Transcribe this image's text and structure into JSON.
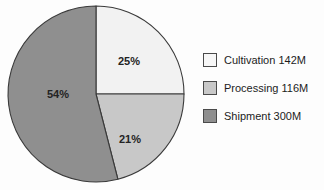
{
  "chart_data": {
    "type": "pie",
    "title": "",
    "categories": [
      "Cultivation",
      "Processing",
      "Shipment"
    ],
    "values": [
      142,
      116,
      300
    ],
    "value_unit": "M",
    "percentages": [
      25,
      21,
      54
    ],
    "slice_labels": [
      "25%",
      "21%",
      "54%"
    ],
    "colors": [
      "#f2f2f2",
      "#c8c8c8",
      "#8f8f8f"
    ],
    "legend_position": "right",
    "grid": false,
    "start_angle_deg": 0,
    "direction": "clockwise",
    "background": "#fdfdfd",
    "outline_color": "#3a3a3a"
  },
  "pie": {
    "center_x": 96,
    "center_y": 94,
    "radius": 88,
    "slices": [
      {
        "name": "Cultivation",
        "label": "25%",
        "percent": 25,
        "color": "#f2f2f2",
        "label_x": 129,
        "label_y": 62
      },
      {
        "name": "Processing",
        "label": "21%",
        "percent": 21,
        "color": "#c8c8c8",
        "label_x": 130,
        "label_y": 140
      },
      {
        "name": "Shipment",
        "label": "54%",
        "percent": 54,
        "color": "#8f8f8f",
        "label_x": 58,
        "label_y": 95
      }
    ]
  },
  "legend": {
    "items": [
      {
        "label": "Cultivation 142M",
        "color": "#f7f7f7",
        "series": "Cultivation"
      },
      {
        "label": "Processing 116M",
        "color": "#c8c8c8",
        "series": "Processing"
      },
      {
        "label": "Shipment 300M",
        "color": "#8f8f8f",
        "series": "Shipment"
      }
    ]
  }
}
